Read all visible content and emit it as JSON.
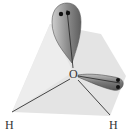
{
  "diagram": {
    "atoms": {
      "central": "O",
      "hydrogen_left": "H",
      "hydrogen_right": "H"
    },
    "lone_pairs": 2,
    "colors": {
      "background_plane": "#e2e2e2",
      "lobe_dark": "#6a6a6a",
      "lobe_light": "#cfcfcf",
      "electron": "#111111",
      "bond": "#333333"
    }
  }
}
